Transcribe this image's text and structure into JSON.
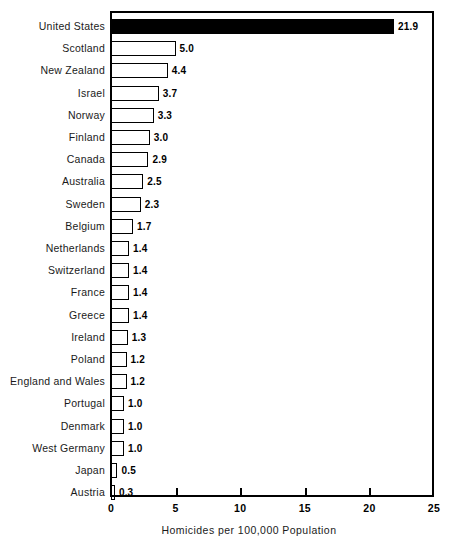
{
  "chart_data": {
    "type": "bar",
    "orientation": "horizontal",
    "title": "",
    "xlabel": "Homicides per 100,000 Population",
    "ylabel": "",
    "xlim": [
      0,
      25
    ],
    "xticks": [
      0,
      5,
      10,
      15,
      20,
      25
    ],
    "xtick_labels": [
      "0",
      "5",
      "10",
      "15",
      "20",
      "25"
    ],
    "grid": false,
    "legend": null,
    "categories": [
      "United States",
      "Scotland",
      "New Zealand",
      "Israel",
      "Norway",
      "Finland",
      "Canada",
      "Australia",
      "Sweden",
      "Belgium",
      "Netherlands",
      "Switzerland",
      "France",
      "Greece",
      "Ireland",
      "Poland",
      "England and Wales",
      "Portugal",
      "Denmark",
      "West Germany",
      "Japan",
      "Austria"
    ],
    "values": [
      21.9,
      5.0,
      4.4,
      3.7,
      3.3,
      3.0,
      2.9,
      2.5,
      2.3,
      1.7,
      1.4,
      1.4,
      1.4,
      1.4,
      1.3,
      1.2,
      1.2,
      1.0,
      1.0,
      1.0,
      0.5,
      0.3
    ],
    "value_labels": [
      "21.9",
      "5.0",
      "4.4",
      "3.7",
      "3.3",
      "3.0",
      "2.9",
      "2.5",
      "2.3",
      "1.7",
      "1.4",
      "1.4",
      "1.4",
      "1.4",
      "1.3",
      "1.2",
      "1.2",
      "1.0",
      "1.0",
      "1.0",
      "0.5",
      "0.3"
    ],
    "highlighted_index": 0,
    "colors": {
      "bar_fill": "#ffffff",
      "bar_edge": "#000000",
      "highlight_fill": "#000000",
      "background": "#ffffff",
      "text": "#000000"
    }
  }
}
